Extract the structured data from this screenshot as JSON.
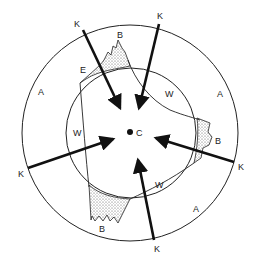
{
  "diagram": {
    "center_label": "C",
    "labels": {
      "K": "K",
      "A": "A",
      "W": "W",
      "B": "B",
      "E": "E"
    },
    "k_labels": [
      "K",
      "K",
      "K",
      "K",
      "K",
      "K"
    ],
    "a_labels": [
      "A",
      "A",
      "A"
    ],
    "w_labels": [
      "W",
      "W",
      "W",
      "W"
    ],
    "b_labels": [
      "B",
      "B",
      "B"
    ],
    "e_label": "E",
    "colors": {
      "line": "#111111",
      "stipple": "#bdbdbd",
      "background": "#ffffff"
    }
  }
}
